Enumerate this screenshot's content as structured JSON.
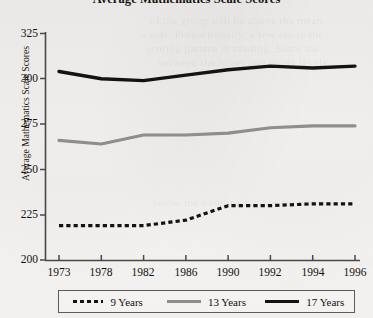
{
  "chart_data": {
    "type": "line",
    "title": "Average Mathematics Scale Scores",
    "xlabel": "",
    "ylabel": "Average Mathematics Scale Scores",
    "categories": [
      "1973",
      "1978",
      "1982",
      "1986",
      "1990",
      "1992",
      "1994",
      "1996"
    ],
    "x": [
      "1973",
      "1978",
      "1982",
      "1986",
      "1990",
      "1992",
      "1994",
      "1996"
    ],
    "ylim": [
      200,
      325
    ],
    "yticks": [
      200,
      225,
      250,
      275,
      300,
      325
    ],
    "grid": false,
    "legend_position": "bottom",
    "series": [
      {
        "name": "9 Years",
        "style": "dashed",
        "color": "#131313",
        "values": [
          219,
          219,
          219,
          222,
          230,
          230,
          231,
          231
        ]
      },
      {
        "name": "13 Years",
        "style": "solid",
        "color": "#8e8e8e",
        "values": [
          266,
          264,
          269,
          269,
          270,
          273,
          274,
          274
        ]
      },
      {
        "name": "17 Years",
        "style": "solid-thick",
        "color": "#131313",
        "values": [
          304,
          300,
          299,
          302,
          305,
          307,
          306,
          307
        ]
      }
    ]
  },
  "legend": {
    "entries": [
      {
        "label": "9 Years",
        "swatch": "dashed-line-swatch"
      },
      {
        "label": "13 Years",
        "swatch": "gray-line-swatch"
      },
      {
        "label": "17 Years",
        "swatch": "black-line-swatch"
      }
    ]
  },
  "background_bleed": {
    "lines": [
      "of the group will be above the mean",
      "wards. Proportionally, a few chose the",
      "scoring pattern in reading. Since the",
      "between the lower and upper levels",
      "below the baseline but not continuous"
    ]
  }
}
